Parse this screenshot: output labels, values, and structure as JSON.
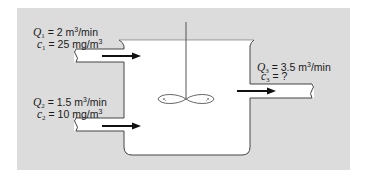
{
  "diagram": {
    "type": "mixing-tank",
    "colors": {
      "background": "#dcdcdc",
      "tank_fill": "#ffffff",
      "outline": "#444444",
      "arrow": "#111111"
    },
    "inflow_1": {
      "flow_var": "Q",
      "flow_sub": "1",
      "flow_text": " = 2 m",
      "flow_sup": "3",
      "flow_unit": "/min",
      "conc_var": "c",
      "conc_sub": "1",
      "conc_text": " = 25 mg/m",
      "conc_sup": "3"
    },
    "inflow_2": {
      "flow_var": "Q",
      "flow_sub": "2",
      "flow_text": " = 1.5 m",
      "flow_sup": "3",
      "flow_unit": "/min",
      "conc_var": "c",
      "conc_sub": "2",
      "conc_text": " = 10 mg/m",
      "conc_sup": "3"
    },
    "outflow_3": {
      "flow_var": "Q",
      "flow_sub": "3",
      "flow_text": " = 3.5 m",
      "flow_sup": "3",
      "flow_unit": "/min",
      "conc_var": "c",
      "conc_sub": "3",
      "conc_text": " = ?"
    }
  }
}
